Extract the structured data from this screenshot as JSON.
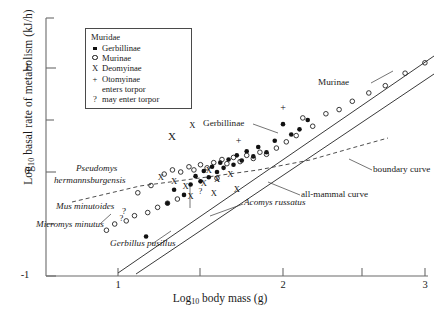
{
  "chart_data": {
    "type": "scatter",
    "title": "",
    "xlabel": "Log10 body mass (g)",
    "ylabel": "Log10 basal rate of metabolism (kJ/h)",
    "xlim": [
      0.55,
      3.0
    ],
    "ylim": [
      -1.0,
      1.35
    ],
    "xticks": [
      1,
      2,
      3
    ],
    "xticklabels": [
      "1",
      "2",
      "3"
    ],
    "xminorticks": [
      1.5,
      2.5
    ],
    "yticks": [
      1,
      0,
      -1
    ],
    "yticklabels": [
      "1",
      "0",
      "-1"
    ],
    "yminorticks": [
      1.35,
      0.5,
      -0.5
    ],
    "grid": false,
    "legend_position": "top-left",
    "series": [
      {
        "name": "Gerbillinae",
        "marker": "filled-circle",
        "points": [
          [
            1.17,
            -0.62
          ],
          [
            1.3,
            -0.3
          ],
          [
            1.34,
            -0.17
          ],
          [
            1.4,
            -0.22
          ],
          [
            1.44,
            -0.12
          ],
          [
            1.47,
            -0.04
          ],
          [
            1.5,
            -0.09
          ],
          [
            1.52,
            0.01
          ],
          [
            1.55,
            -0.05
          ],
          [
            1.57,
            0.05
          ],
          [
            1.6,
            0.0
          ],
          [
            1.62,
            0.09
          ],
          [
            1.64,
            0.04
          ],
          [
            1.67,
            0.12
          ],
          [
            1.7,
            0.07
          ],
          [
            1.72,
            0.16
          ],
          [
            1.75,
            0.11
          ],
          [
            1.78,
            0.2
          ],
          [
            1.82,
            0.15
          ],
          [
            1.85,
            0.24
          ],
          [
            1.9,
            0.19
          ],
          [
            1.95,
            0.3
          ],
          [
            2.0,
            0.46
          ],
          [
            2.05,
            0.36
          ],
          [
            2.1,
            0.41
          ],
          [
            2.15,
            0.5
          ]
        ]
      },
      {
        "name": "Murinae",
        "marker": "open-circle",
        "points": [
          [
            0.93,
            -0.56
          ],
          [
            0.98,
            -0.5
          ],
          [
            1.05,
            -0.47
          ],
          [
            1.1,
            -0.42
          ],
          [
            1.18,
            -0.39
          ],
          [
            1.24,
            -0.34
          ],
          [
            1.3,
            -0.3
          ],
          [
            1.36,
            -0.26
          ],
          [
            1.28,
            -0.02
          ],
          [
            1.33,
            0.02
          ],
          [
            1.38,
            0.0
          ],
          [
            1.43,
            0.05
          ],
          [
            1.46,
            0.02
          ],
          [
            1.5,
            0.07
          ],
          [
            1.54,
            0.04
          ],
          [
            1.58,
            0.09
          ],
          [
            1.6,
            -0.06
          ],
          [
            1.63,
            0.12
          ],
          [
            1.66,
            0.08
          ],
          [
            1.7,
            0.14
          ],
          [
            1.74,
            0.1
          ],
          [
            1.78,
            0.16
          ],
          [
            1.82,
            0.13
          ],
          [
            1.86,
            0.19
          ],
          [
            1.9,
            0.17
          ],
          [
            1.96,
            0.23
          ],
          [
            2.02,
            0.29
          ],
          [
            2.08,
            0.35
          ],
          [
            2.12,
            0.52
          ],
          [
            2.18,
            0.44
          ],
          [
            2.26,
            0.56
          ],
          [
            2.34,
            0.6
          ],
          [
            2.42,
            0.68
          ],
          [
            2.52,
            0.76
          ],
          [
            2.62,
            0.83
          ],
          [
            2.74,
            0.95
          ],
          [
            2.86,
            1.05
          ],
          [
            1.2,
            -0.13
          ],
          [
            1.12,
            -0.2
          ]
        ]
      },
      {
        "name": "Deomyinae",
        "marker": "x",
        "points": [
          [
            1.45,
            0.45
          ],
          [
            1.26,
            -0.05
          ],
          [
            1.34,
            -0.09
          ],
          [
            1.41,
            -0.13
          ],
          [
            1.52,
            -0.11
          ],
          [
            1.6,
            -0.07
          ],
          [
            1.68,
            -0.02
          ],
          [
            1.58,
            -0.2
          ],
          [
            1.44,
            -0.23
          ],
          [
            1.72,
            -0.16
          ],
          [
            1.55,
            0.02
          ]
        ]
      },
      {
        "name": "Otomyinae",
        "marker": "plus",
        "points": [
          [
            1.73,
            0.3
          ],
          [
            2.0,
            0.62
          ]
        ]
      },
      {
        "name": "may enter torpor",
        "marker": "question",
        "points": [
          [
            1.02,
            -0.44
          ],
          [
            1.5,
            -0.18
          ]
        ]
      }
    ],
    "lines": [
      {
        "name": "Murinae curve",
        "style": "solid",
        "x": [
          1.17,
          2.95
        ],
        "y": [
          -0.97,
          1.12
        ]
      },
      {
        "name": "all-mammal curve",
        "style": "solid",
        "x": [
          1.28,
          2.95
        ],
        "y": [
          -0.98,
          0.95
        ]
      },
      {
        "name": "boundary curve",
        "style": "dashed",
        "x": [
          0.72,
          2.62
        ],
        "y": [
          -0.29,
          0.28
        ]
      }
    ]
  },
  "legend": {
    "title": "Muridae",
    "items": [
      {
        "glyph": "filled-circle",
        "label": "Gerbillinae"
      },
      {
        "glyph": "open-circle",
        "label": "Murinae"
      },
      {
        "glyph": "X",
        "label": "Deomyinae"
      },
      {
        "glyph": "+",
        "label": "Otomyinae"
      },
      {
        "glyph": "",
        "label": "enters torpor"
      },
      {
        "glyph": "?",
        "label": "may enter torpor"
      }
    ]
  },
  "axes": {
    "ylabel": "Log10 basal rate of metabolism (kJ/h)",
    "ylabel_prefix": "Log",
    "ylabel_sub": "10",
    "ylabel_rest": " basal rate of metabolism (kJ/h)",
    "xlabel_prefix": "Log",
    "xlabel_sub": "10",
    "xlabel_rest": " body mass (g)",
    "ytick_1": "1",
    "ytick_0": "0",
    "ytick_m1": "-1",
    "xtick_1": "1",
    "xtick_2": "2",
    "xtick_3": "3"
  },
  "annotations": {
    "murinae": "Murinae",
    "gerbillinae": "Gerbillinae",
    "boundary_curve": "boundary curve",
    "all_mammal_curve": "all-mammal curve",
    "pseudomys_line1": "Pseudomys",
    "pseudomys_line2": "hermannsburgensis",
    "mus_minutoides": "Mus minutoides",
    "micromys_minutus": "Micromys minutus",
    "gerbillus_pusillus": "Gerbillus pusillus",
    "acomys_russatus": "Acomys russatus",
    "lone_x": "X",
    "question_1": "?",
    "question_2": "?"
  }
}
